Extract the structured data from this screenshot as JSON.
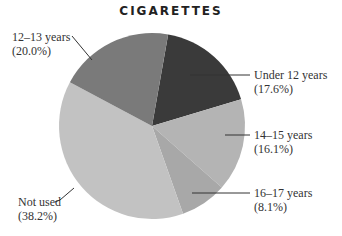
{
  "chart_data": {
    "type": "pie",
    "title": "CIGARETTES",
    "categories": [
      "Under 12 years",
      "14–15 years",
      "16–17 years",
      "Not used",
      "12–13 years"
    ],
    "values": [
      17.6,
      16.1,
      8.1,
      38.2,
      20.0
    ],
    "labels": [
      {
        "name": "Under 12 years",
        "pct": "(17.6%)",
        "color": "#3a3a3a"
      },
      {
        "name": "14–15 years",
        "pct": "(16.1%)",
        "color": "#b4b4b4"
      },
      {
        "name": "16–17 years",
        "pct": "(8.1%)",
        "color": "#a8a8a8"
      },
      {
        "name": "Not used",
        "pct": "(38.2%)",
        "color": "#c2c2c2"
      },
      {
        "name": "12–13 years",
        "pct": "(20.0%)",
        "color": "#7a7a7a"
      }
    ],
    "legend": "none (direct labels with leader lines)"
  }
}
